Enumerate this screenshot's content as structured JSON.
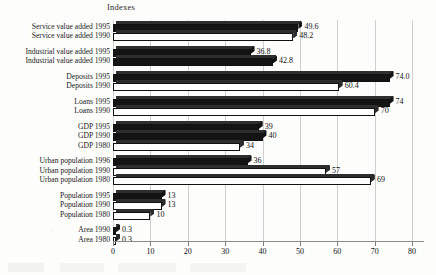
{
  "chart_data": {
    "type": "bar",
    "orientation": "horizontal",
    "title": "Indexes",
    "xlabel": "",
    "ylabel": "",
    "xlim": [
      0,
      80
    ],
    "xticks": [
      0,
      10,
      20,
      30,
      40,
      50,
      60,
      70,
      80
    ],
    "grid": true,
    "legend": "none",
    "categories": [
      "Service value added 1995",
      "Service value added 1990",
      "Industrial value added 1995",
      "Industrial value added 1990",
      "Deposits 1995",
      "Deposits 1990",
      "Loans 1995",
      "Loans 1990",
      "GDP 1995",
      "GDP 1990",
      "GDP 1980",
      "Urban population 1996",
      "Urban population 1990",
      "Urban population 1980",
      "Population 1995",
      "Population 1990",
      "Population 1980",
      "Area 1990",
      "Area 1980"
    ],
    "values": [
      49.6,
      48.2,
      36.8,
      42.8,
      74.0,
      60.4,
      74,
      70,
      39,
      40,
      34,
      36,
      57,
      69,
      13,
      13,
      10,
      0.3,
      0.3
    ],
    "value_labels": [
      "49.6",
      "48.2",
      "36.8",
      "42.8",
      "74.0",
      "60.4",
      "74",
      "70",
      "39",
      "40",
      "34",
      "36",
      "57",
      "69",
      "13",
      "13",
      "10",
      "0.3",
      "0.3"
    ],
    "fills": [
      "dark",
      "light",
      "dark",
      "dark",
      "dark",
      "light",
      "dark",
      "light",
      "dark",
      "dark",
      "light",
      "dark",
      "light",
      "light",
      "dark",
      "light",
      "light",
      "dark",
      "light"
    ],
    "groups": [
      {
        "name": "Service value added",
        "size": 2
      },
      {
        "name": "Industrial value added",
        "size": 2
      },
      {
        "name": "Deposits",
        "size": 2
      },
      {
        "name": "Loans",
        "size": 2
      },
      {
        "name": "GDP",
        "size": 3
      },
      {
        "name": "Urban population",
        "size": 3
      },
      {
        "name": "Population",
        "size": 3
      },
      {
        "name": "Area",
        "size": 2
      }
    ]
  }
}
